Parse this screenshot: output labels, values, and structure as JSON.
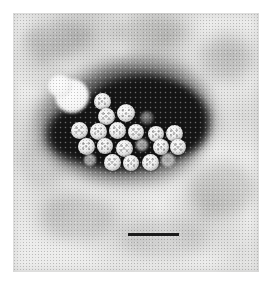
{
  "figure": {
    "kind": "transmission-electron-micrograph",
    "technique": "negative stain",
    "caption": "",
    "width_px": 271,
    "height_px": 282,
    "background_color": "#ffffff"
  },
  "micrograph": {
    "left": 13,
    "top": 13,
    "width": 246,
    "height": 259,
    "film_color": "#ececeb",
    "stain_color": "#151515",
    "particle_color": "#f4f4f4"
  },
  "scale_bar": {
    "label": "",
    "x": 128,
    "y": 233,
    "length_px": 51,
    "thickness_px": 3,
    "color": "#1b1b1b"
  },
  "stain_pool": {
    "blobs": [
      {
        "left": 18,
        "top": 26,
        "width": 132,
        "height": 72,
        "radius": "46% 54% 52% 48% / 56% 44% 58% 42%"
      },
      {
        "left": 46,
        "top": 10,
        "width": 104,
        "height": 62,
        "radius": "52% 48% 44% 56% / 48% 56% 44% 52%"
      },
      {
        "left": 2,
        "top": 40,
        "width": 72,
        "height": 56,
        "radius": "50% 50% 46% 54% / 52% 48% 54% 46%"
      },
      {
        "left": 86,
        "top": 22,
        "width": 78,
        "height": 70,
        "radius": "48% 52% 54% 46% / 50% 52% 46% 54%"
      },
      {
        "left": 30,
        "top": 56,
        "width": 96,
        "height": 48,
        "radius": "52% 48% 50% 50% / 54% 46% 52% 48%"
      }
    ],
    "halos": [
      {
        "left": -8,
        "top": 6,
        "width": 164,
        "height": 100,
        "radius": "50% 50% 48% 52% / 54% 46% 56% 44%"
      },
      {
        "left": 36,
        "top": -6,
        "width": 128,
        "height": 96,
        "radius": "48% 52% 52% 48% / 46% 54% 48% 52%"
      },
      {
        "left": 10,
        "top": 46,
        "width": 142,
        "height": 70,
        "radius": "52% 48% 46% 54% / 52% 48% 52% 48%"
      }
    ]
  },
  "virions": {
    "count": 21,
    "diameter_px": 17,
    "particles": [
      {
        "cx": 102,
        "cy": 101,
        "d": 17,
        "style": ""
      },
      {
        "cx": 106,
        "cy": 116,
        "d": 17,
        "style": ""
      },
      {
        "cx": 126,
        "cy": 113,
        "d": 18,
        "style": ""
      },
      {
        "cx": 147,
        "cy": 118,
        "d": 14,
        "style": "broken"
      },
      {
        "cx": 79,
        "cy": 130,
        "d": 17,
        "style": ""
      },
      {
        "cx": 98,
        "cy": 131,
        "d": 17,
        "style": ""
      },
      {
        "cx": 117,
        "cy": 130,
        "d": 17,
        "style": ""
      },
      {
        "cx": 136,
        "cy": 132,
        "d": 16,
        "style": ""
      },
      {
        "cx": 156,
        "cy": 134,
        "d": 16,
        "style": ""
      },
      {
        "cx": 174,
        "cy": 133,
        "d": 17,
        "style": ""
      },
      {
        "cx": 86,
        "cy": 146,
        "d": 17,
        "style": ""
      },
      {
        "cx": 105,
        "cy": 146,
        "d": 16,
        "style": ""
      },
      {
        "cx": 124,
        "cy": 148,
        "d": 17,
        "style": ""
      },
      {
        "cx": 142,
        "cy": 145,
        "d": 12,
        "style": "faint"
      },
      {
        "cx": 161,
        "cy": 147,
        "d": 16,
        "style": ""
      },
      {
        "cx": 178,
        "cy": 147,
        "d": 16,
        "style": ""
      },
      {
        "cx": 112,
        "cy": 162,
        "d": 17,
        "style": ""
      },
      {
        "cx": 131,
        "cy": 163,
        "d": 16,
        "style": ""
      },
      {
        "cx": 150,
        "cy": 162,
        "d": 17,
        "style": ""
      },
      {
        "cx": 168,
        "cy": 160,
        "d": 14,
        "style": "faint"
      },
      {
        "cx": 90,
        "cy": 160,
        "d": 12,
        "style": "faint"
      }
    ]
  },
  "blebs": [
    {
      "cx": 72,
      "cy": 96,
      "w": 34,
      "h": 34
    },
    {
      "cx": 60,
      "cy": 86,
      "w": 24,
      "h": 22
    }
  ],
  "smudges": [
    {
      "left": 10,
      "top": 6,
      "w": 64,
      "h": 38,
      "opacity": 0.26
    },
    {
      "left": 96,
      "top": 2,
      "w": 78,
      "h": 34,
      "opacity": 0.22
    },
    {
      "left": 186,
      "top": 24,
      "w": 54,
      "h": 44,
      "opacity": 0.2
    },
    {
      "left": 4,
      "top": 126,
      "w": 50,
      "h": 48,
      "opacity": 0.18
    },
    {
      "left": 176,
      "top": 150,
      "w": 66,
      "h": 52,
      "opacity": 0.22
    },
    {
      "left": 28,
      "top": 182,
      "w": 74,
      "h": 46,
      "opacity": 0.2
    },
    {
      "left": 108,
      "top": 206,
      "w": 86,
      "h": 40,
      "opacity": 0.16
    },
    {
      "left": 150,
      "top": 92,
      "w": 60,
      "h": 40,
      "opacity": 0.18
    }
  ]
}
